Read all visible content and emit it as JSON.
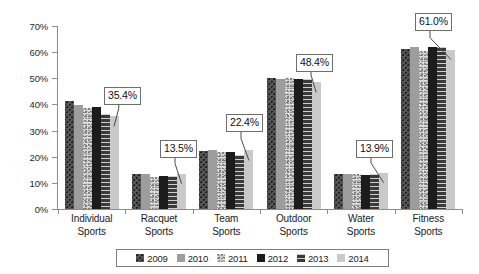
{
  "chart_data": {
    "type": "bar",
    "title": "",
    "subtitle": "",
    "xlabel": "",
    "ylabel": "",
    "ylim": [
      0,
      70
    ],
    "ytick_labels": [
      "0%",
      "10%",
      "20%",
      "30%",
      "40%",
      "50%",
      "60%",
      "70%"
    ],
    "ytick_values": [
      0,
      10,
      20,
      30,
      40,
      50,
      60,
      70
    ],
    "grid": false,
    "legend_position": "bottom-center",
    "categories": [
      "Individual Sports",
      "Racquet Sports",
      "Team Sports",
      "Outdoor Sports",
      "Water Sports",
      "Fitness Sports"
    ],
    "category_lines": [
      [
        "Individual",
        "Sports"
      ],
      [
        "Racquet",
        "Sports"
      ],
      [
        "Team",
        "Sports"
      ],
      [
        "Outdoor",
        "Sports"
      ],
      [
        "Water",
        "Sports"
      ],
      [
        "Fitness",
        "Sports"
      ]
    ],
    "series": [
      {
        "name": "2009",
        "swatch_class": "s2009",
        "values": [
          41.2,
          13.4,
          22.3,
          50.0,
          13.4,
          61.2
        ]
      },
      {
        "name": "2010",
        "swatch_class": "s2010",
        "values": [
          39.6,
          13.3,
          22.7,
          49.9,
          13.3,
          61.9
        ]
      },
      {
        "name": "2011",
        "swatch_class": "s2011",
        "values": [
          38.6,
          12.4,
          22.0,
          50.3,
          13.4,
          60.4
        ]
      },
      {
        "name": "2012",
        "swatch_class": "s2012",
        "values": [
          39.0,
          12.7,
          21.9,
          49.8,
          13.2,
          62.1
        ]
      },
      {
        "name": "2013",
        "swatch_class": "s2013",
        "values": [
          36.2,
          12.6,
          20.8,
          49.9,
          13.3,
          62.0
        ]
      },
      {
        "name": "2014",
        "swatch_class": "s2014",
        "values": [
          35.4,
          13.5,
          22.4,
          48.4,
          13.9,
          61.0
        ]
      }
    ],
    "annotations": [
      {
        "text": "35.4%",
        "category": "Individual Sports",
        "series": "2014",
        "value": 35.4
      },
      {
        "text": "13.5%",
        "category": "Racquet Sports",
        "series": "2014",
        "value": 13.5
      },
      {
        "text": "22.4%",
        "category": "Team Sports",
        "series": "2014",
        "value": 22.4
      },
      {
        "text": "48.4%",
        "category": "Outdoor Sports",
        "series": "2014",
        "value": 48.4
      },
      {
        "text": "13.9%",
        "category": "Water Sports",
        "series": "2014",
        "value": 13.9
      },
      {
        "text": "61.0%",
        "category": "Fitness Sports",
        "series": "2014",
        "value": 61.0
      }
    ]
  },
  "legend": {
    "items": [
      {
        "label": "2009"
      },
      {
        "label": "2010"
      },
      {
        "label": "2011"
      },
      {
        "label": "2012"
      },
      {
        "label": "2013"
      },
      {
        "label": "2014"
      }
    ]
  },
  "colors": {
    "axis": "#8d8d8d",
    "text": "#1b1b1b",
    "callout_border": "#6e6e6e",
    "series_2009": "#555555",
    "series_2010": "#9d9d9d",
    "series_2011": "#dcdcdc",
    "series_2012": "#1c1c1c",
    "series_2013": "#4a4a4a",
    "series_2014": "#c9c9c9"
  }
}
